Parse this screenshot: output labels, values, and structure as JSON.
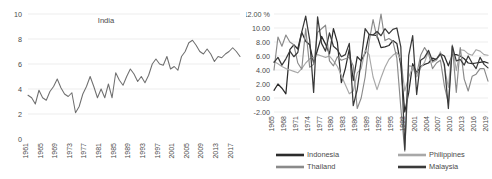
{
  "figure": {
    "name": "two-panel-gdp-growth-figure",
    "background": "#ffffff"
  },
  "chart_data": [
    {
      "id": "india-chart",
      "type": "line",
      "title": "India",
      "xlabel": "",
      "ylabel": "",
      "ylim": [
        0,
        10
      ],
      "yticks": [
        0,
        2,
        4,
        6,
        8,
        10
      ],
      "ytick_labels": [
        "0",
        "2",
        "4",
        "6",
        "8",
        "10"
      ],
      "grid": true,
      "legend_position": "none",
      "xlim": [
        1961,
        2019
      ],
      "xtick_labels": [
        "1961",
        "1965",
        "1969",
        "1973",
        "1977",
        "1981",
        "1985",
        "1989",
        "1993",
        "1997",
        "2001",
        "2005",
        "2009",
        "2013",
        "2017"
      ],
      "x": [
        1961,
        1962,
        1963,
        1964,
        1965,
        1966,
        1967,
        1968,
        1969,
        1970,
        1971,
        1972,
        1973,
        1974,
        1975,
        1976,
        1977,
        1978,
        1979,
        1980,
        1981,
        1982,
        1983,
        1984,
        1985,
        1986,
        1987,
        1988,
        1989,
        1990,
        1991,
        1992,
        1993,
        1994,
        1995,
        1996,
        1997,
        1998,
        1999,
        2000,
        2001,
        2002,
        2003,
        2004,
        2005,
        2006,
        2007,
        2008,
        2009,
        2010,
        2011,
        2012,
        2013,
        2014,
        2015,
        2016,
        2017,
        2018,
        2019
      ],
      "series": [
        {
          "name": "India",
          "color": "#6f6f6f",
          "values": [
            3.5,
            3.3,
            2.8,
            3.9,
            3.3,
            3.1,
            3.8,
            4.2,
            4.8,
            4.1,
            3.6,
            3.4,
            3.7,
            2.1,
            2.6,
            3.6,
            4.2,
            5.0,
            4.2,
            3.3,
            4.0,
            3.3,
            4.4,
            3.3,
            5.3,
            4.7,
            4.3,
            5.0,
            5.6,
            5.2,
            4.6,
            5.0,
            4.5,
            5.1,
            6.0,
            6.4,
            6.0,
            5.9,
            6.6,
            5.6,
            5.8,
            5.5,
            6.6,
            7.0,
            7.7,
            7.9,
            7.5,
            7.0,
            6.8,
            7.2,
            6.8,
            6.2,
            6.6,
            6.5,
            6.8,
            7.0,
            7.3,
            7.0,
            6.6
          ]
        }
      ]
    },
    {
      "id": "asean-chart",
      "type": "line",
      "title": "",
      "xlabel": "",
      "ylabel": "",
      "ylim": [
        -2,
        12
      ],
      "yticks": [
        -2,
        0,
        2,
        4,
        6,
        8,
        10,
        12
      ],
      "ytick_labels": [
        "-2.00",
        "0.00",
        "2.00",
        "4.00",
        "6.00",
        "8.00",
        "10.00",
        "12.00 %"
      ],
      "grid": true,
      "legend_position": "bottom",
      "xlim": [
        1965,
        2019
      ],
      "xtick_labels": [
        "1965",
        "1968",
        "1971",
        "1974",
        "1977",
        "1980",
        "1983",
        "1986",
        "1989",
        "1992",
        "1995",
        "1998",
        "2001",
        "2004",
        "2007",
        "2010",
        "2013",
        "2016",
        "2019"
      ],
      "x": [
        1965,
        1966,
        1967,
        1968,
        1969,
        1970,
        1971,
        1972,
        1973,
        1974,
        1975,
        1976,
        1977,
        1978,
        1979,
        1980,
        1981,
        1982,
        1983,
        1984,
        1985,
        1986,
        1987,
        1988,
        1989,
        1990,
        1991,
        1992,
        1993,
        1994,
        1995,
        1996,
        1997,
        1998,
        1999,
        2000,
        2001,
        2002,
        2003,
        2004,
        2005,
        2006,
        2007,
        2008,
        2009,
        2010,
        2011,
        2012,
        2013,
        2014,
        2015,
        2016,
        2017,
        2018,
        2019
      ],
      "series": [
        {
          "name": "Indonesia",
          "color": "#2b2b2b",
          "values": [
            1.1,
            2.0,
            1.4,
            0.6,
            6.9,
            7.6,
            7.0,
            9.4,
            8.1,
            7.6,
            5.0,
            6.9,
            8.8,
            7.7,
            6.3,
            9.9,
            7.9,
            2.2,
            4.2,
            7.0,
            2.5,
            5.9,
            5.3,
            6.4,
            9.1,
            9.0,
            8.9,
            7.2,
            7.3,
            7.5,
            8.2,
            7.8,
            4.7,
            -2.0,
            0.8,
            4.9,
            3.6,
            4.5,
            4.8,
            5.0,
            5.7,
            5.5,
            6.3,
            6.0,
            4.6,
            6.2,
            6.2,
            6.0,
            5.6,
            5.0,
            4.9,
            5.0,
            5.1,
            5.2,
            5.0
          ]
        },
        {
          "name": "Philippines",
          "color": "#a8a8a8",
          "values": [
            5.2,
            4.9,
            4.5,
            4.2,
            4.0,
            3.8,
            3.6,
            4.2,
            5.0,
            5.6,
            5.8,
            6.2,
            6.0,
            5.8,
            6.0,
            5.3,
            4.5,
            3.2,
            1.9,
            0.6,
            1.0,
            3.6,
            4.2,
            6.8,
            6.2,
            3.0,
            1.2,
            2.9,
            4.4,
            5.5,
            6.1,
            6.5,
            5.5,
            1.0,
            3.0,
            4.4,
            3.0,
            4.3,
            5.1,
            6.7,
            5.1,
            5.4,
            6.6,
            4.4,
            1.5,
            7.6,
            3.9,
            6.9,
            6.8,
            6.3,
            6.1,
            6.9,
            6.7,
            6.2,
            6.1
          ]
        },
        {
          "name": "Thailand",
          "color": "#8a8a8a",
          "values": [
            4.0,
            8.7,
            7.4,
            9.0,
            8.0,
            7.6,
            5.0,
            4.1,
            9.9,
            4.4,
            4.8,
            9.4,
            9.9,
            10.4,
            5.3,
            4.6,
            5.9,
            5.4,
            5.6,
            5.8,
            4.6,
            -1.5,
            0.0,
            3.0,
            8.0,
            11.2,
            8.6,
            12.0,
            8.2,
            8.5,
            8.1,
            5.7,
            -1.4,
            -7.6,
            4.6,
            4.5,
            3.4,
            6.1,
            7.2,
            6.3,
            4.2,
            5.0,
            5.4,
            1.7,
            -0.7,
            7.5,
            0.8,
            7.2,
            2.7,
            1.0,
            3.1,
            3.4,
            4.2,
            4.2,
            2.4
          ]
        },
        {
          "name": "Malaysia",
          "color": "#3a3a3a",
          "values": [
            5.1,
            5.8,
            4.7,
            5.6,
            6.7,
            5.9,
            6.5,
            9.4,
            11.7,
            8.3,
            0.8,
            11.6,
            7.8,
            6.7,
            9.3,
            7.4,
            6.9,
            5.9,
            6.2,
            7.8,
            -1.1,
            1.2,
            5.4,
            9.9,
            9.1,
            9.0,
            9.5,
            8.9,
            9.9,
            9.2,
            9.8,
            10.0,
            7.3,
            -7.4,
            6.1,
            8.9,
            0.5,
            5.4,
            5.8,
            6.8,
            5.3,
            5.6,
            6.3,
            4.8,
            -1.5,
            7.4,
            5.3,
            5.5,
            4.7,
            6.0,
            5.0,
            4.2,
            5.8,
            4.8,
            4.3
          ]
        }
      ],
      "legend_entries": [
        {
          "label": "Indonesia",
          "color": "#2b2b2b"
        },
        {
          "label": "Philippines",
          "color": "#a8a8a8"
        },
        {
          "label": "Thailand",
          "color": "#8a8a8a"
        },
        {
          "label": "Malaysia",
          "color": "#3a3a3a"
        }
      ]
    }
  ]
}
